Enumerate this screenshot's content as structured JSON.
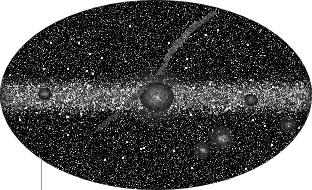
{
  "figure": {
    "type": "all-sky-map",
    "projection": "mollweide",
    "background_color": "#ffffff",
    "sky_color": "#050505",
    "width": 312,
    "height": 190
  },
  "chart_data": {
    "type": "scatter",
    "title": "",
    "subtitle": "",
    "xlabel": "",
    "ylabel": "",
    "projection": "mollweide",
    "coordinate_frame": "galactic",
    "grid": false,
    "legend": false,
    "xlim": [
      180,
      -180
    ],
    "ylim": [
      -90,
      90
    ],
    "background_color": "#ffffff",
    "field_color": "#050505",
    "point_color": "#ffffff",
    "point_count": 26000,
    "ellipse": {
      "center_x": 156,
      "center_y": 95,
      "semi_major_x": 156,
      "semi_minor_y": 95
    },
    "features": [
      {
        "name": "galactic-plane",
        "kind": "band",
        "center_x": 156,
        "center_y": 96,
        "half_thickness": 11,
        "density_boost": 2.6,
        "brightness_boost": 1.5
      },
      {
        "name": "galactic-bulge",
        "kind": "blob",
        "x": 156,
        "y": 96,
        "radius": 16,
        "brightness": 0.85
      },
      {
        "name": "large-magellanic-cloud",
        "kind": "blob",
        "x": 222,
        "y": 138,
        "radius": 7,
        "brightness": 1.0
      },
      {
        "name": "small-magellanic-cloud",
        "kind": "blob",
        "x": 202,
        "y": 150,
        "radius": 5,
        "brightness": 0.9
      },
      {
        "name": "bright-knot-left-plane",
        "kind": "blob",
        "x": 44,
        "y": 93,
        "radius": 6,
        "brightness": 0.75
      },
      {
        "name": "bright-knot-right-plane",
        "kind": "blob",
        "x": 250,
        "y": 99,
        "radius": 6,
        "brightness": 0.7
      },
      {
        "name": "bright-knot-right-edge",
        "kind": "blob",
        "x": 288,
        "y": 124,
        "radius": 5,
        "brightness": 0.75
      },
      {
        "name": "scan-streak-upper-right",
        "kind": "streak",
        "x1": 166,
        "y1": 58,
        "x2": 196,
        "y2": 22,
        "width": 2.0,
        "brightness": 0.65
      },
      {
        "name": "scan-streak-upper-center",
        "kind": "streak",
        "x1": 160,
        "y1": 72,
        "x2": 176,
        "y2": 40,
        "width": 1.8,
        "brightness": 0.55
      },
      {
        "name": "scan-streak-top",
        "kind": "streak",
        "x1": 190,
        "y1": 30,
        "x2": 214,
        "y2": 12,
        "width": 1.6,
        "brightness": 0.5
      },
      {
        "name": "scan-streak-mid-left",
        "kind": "streak",
        "x1": 126,
        "y1": 104,
        "x2": 146,
        "y2": 86,
        "width": 1.6,
        "brightness": 0.5
      },
      {
        "name": "scan-streak-lower-left",
        "kind": "streak",
        "x1": 96,
        "y1": 130,
        "x2": 118,
        "y2": 112,
        "width": 1.4,
        "brightness": 0.42
      }
    ]
  },
  "annotation": {
    "leader_line": {
      "name": "leader-line",
      "color": "#9a9a9a",
      "x": 41,
      "y_top": 158,
      "y_bottom": 190,
      "length": 32,
      "thickness": 1
    }
  }
}
